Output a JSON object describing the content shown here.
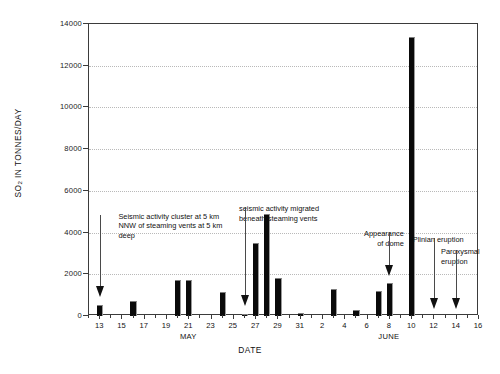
{
  "chart_data": {
    "type": "bar",
    "title": "",
    "subtitle": "",
    "xlabel": "DATE",
    "ylabel": "SO2 IN TONNES/DAY",
    "ylabel_parts": {
      "prefix": "SO",
      "sub": "2",
      "suffix": " IN TONNES/DAY"
    },
    "ylim": [
      0,
      14000
    ],
    "yticks": [
      0,
      2000,
      4000,
      6000,
      8000,
      10000,
      12000,
      14000
    ],
    "ytick_labels": [
      "0",
      "2000",
      "4000",
      "6000",
      "8000",
      "10000",
      "12000",
      "14000"
    ],
    "grid": true,
    "grid_axis": "y",
    "legend": false,
    "xlim_days": [
      12,
      47
    ],
    "x_axis_type": "date",
    "month_labels": [
      {
        "text": "MAY",
        "day_index": 21
      },
      {
        "text": "JUNE",
        "day_index": 39
      }
    ],
    "xtick_labels": [
      {
        "text": "13",
        "day_index": 13
      },
      {
        "text": "15",
        "day_index": 15
      },
      {
        "text": "17",
        "day_index": 17
      },
      {
        "text": "19",
        "day_index": 19
      },
      {
        "text": "21",
        "day_index": 21
      },
      {
        "text": "23",
        "day_index": 23
      },
      {
        "text": "25",
        "day_index": 25
      },
      {
        "text": "27",
        "day_index": 27
      },
      {
        "text": "29",
        "day_index": 29
      },
      {
        "text": "31",
        "day_index": 31
      },
      {
        "text": "2",
        "day_index": 33
      },
      {
        "text": "4",
        "day_index": 35
      },
      {
        "text": "6",
        "day_index": 37
      },
      {
        "text": "8",
        "day_index": 39
      },
      {
        "text": "10",
        "day_index": 41
      },
      {
        "text": "12",
        "day_index": 43
      },
      {
        "text": "14",
        "day_index": 45
      },
      {
        "text": "16",
        "day_index": 47
      }
    ],
    "categories": [
      "May 13",
      "May 16",
      "May 20",
      "May 21",
      "May 24",
      "May 26",
      "May 27",
      "May 28",
      "May 29",
      "May 31",
      "Jun 3",
      "Jun 5",
      "Jun 7",
      "Jun 8",
      "Jun 10"
    ],
    "values": [
      520,
      700,
      1750,
      1750,
      1150,
      100,
      3500,
      4900,
      1800,
      120,
      1300,
      300,
      1200,
      1600,
      13400
    ],
    "bars": [
      {
        "day_index": 13,
        "label": "May 13",
        "value": 520
      },
      {
        "day_index": 16,
        "label": "May 16",
        "value": 700
      },
      {
        "day_index": 20,
        "label": "May 20",
        "value": 1750
      },
      {
        "day_index": 21,
        "label": "May 21",
        "value": 1750
      },
      {
        "day_index": 24,
        "label": "May 24",
        "value": 1150
      },
      {
        "day_index": 26,
        "label": "May 26",
        "value": 100
      },
      {
        "day_index": 27,
        "label": "May 27",
        "value": 3500
      },
      {
        "day_index": 28,
        "label": "May 28",
        "value": 4900
      },
      {
        "day_index": 29,
        "label": "May 29",
        "value": 1800
      },
      {
        "day_index": 31,
        "label": "May 31",
        "value": 120
      },
      {
        "day_index": 34,
        "label": "Jun 3",
        "value": 1300
      },
      {
        "day_index": 36,
        "label": "Jun 5",
        "value": 300
      },
      {
        "day_index": 38,
        "label": "Jun 7",
        "value": 1200
      },
      {
        "day_index": 39,
        "label": "Jun 8",
        "value": 1600
      },
      {
        "day_index": 41,
        "label": "Jun 10",
        "value": 13400
      }
    ],
    "annotations": [
      {
        "id": "seismic-cluster",
        "text": "Seismic activity cluster at 5 km\nNNW of steaming vents at 5 km\ndeep",
        "target_day_index": 13,
        "target_value": 900,
        "text_day_index": 15,
        "text_value": 5000
      },
      {
        "id": "seismic-migrated",
        "text": "seismic activity migrated\nbeneath steaming vents",
        "target_day_index": 26,
        "target_value": 500,
        "text_day_index": 26,
        "text_value": 5350
      },
      {
        "id": "dome-appearance",
        "text": "Appearance\nof dome",
        "target_day_index": 39,
        "target_value": 1900,
        "text_day_index": 39,
        "text_value": 4150
      },
      {
        "id": "plinian-eruption",
        "text": "Plinian eruption",
        "target_day_index": 43,
        "target_value": 350,
        "text_day_index": 45,
        "text_value": 3900
      },
      {
        "id": "paroxysmal-eruption",
        "text": "Paroxysmal\neruption",
        "target_day_index": 45,
        "target_value": 350,
        "text_day_index": 47,
        "text_value": 3300
      }
    ],
    "colors": {
      "bar_fill": "#0a0a0a",
      "bar_edge": "#9a9a9a",
      "axis": "#3b3b3b",
      "grid": "#b9b9b9",
      "text": "#111111",
      "background": "#ffffff"
    }
  }
}
